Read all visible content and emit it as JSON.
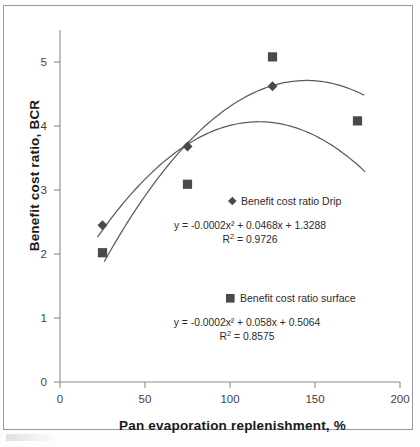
{
  "figure": {
    "background": "#ffffff",
    "border_color": "#9a9a9a"
  },
  "axes": {
    "x_title": "Pan evaporation replenishment, %",
    "y_title": "Benefit cost ratio, BCR",
    "x_ticks": [
      "0",
      "50",
      "100",
      "150",
      "200"
    ],
    "y_ticks": [
      "0",
      "1",
      "2",
      "3",
      "4",
      "5"
    ]
  },
  "legend": {
    "drip": {
      "marker": "diamond-marker",
      "label": "Benefit cost ratio Drip",
      "equation": "y = -0.0002x² + 0.0468x + 1.3288",
      "r2_prefix": "R",
      "r2_sup": "2",
      "r2_value": " = 0.9726"
    },
    "surface": {
      "marker": "square-marker",
      "label": "Benefit cost ratio surface",
      "equation": "y = -0.0002x² + 0.058x + 0.5064",
      "r2_prefix": "R",
      "r2_sup": "2",
      "r2_value": " = 0.8575"
    }
  },
  "colors": {
    "marker": "#4a4a4a",
    "trendline": "#5c5c5c",
    "axis": "#8c8c8c",
    "text": "#2b2b2b"
  },
  "chart_data": {
    "type": "scatter",
    "title": "",
    "xlabel": "Pan evaporation replenishment, %",
    "ylabel": "Benefit cost ratio, BCR",
    "xlim": [
      0,
      200
    ],
    "ylim": [
      0,
      5.5
    ],
    "xticks": [
      0,
      50,
      100,
      150,
      200
    ],
    "yticks": [
      0,
      1,
      2,
      3,
      4,
      5
    ],
    "grid": false,
    "legend_position": "inside-right",
    "series": [
      {
        "name": "Benefit cost ratio Drip",
        "marker": "diamond",
        "x": [
          25,
          75,
          125
        ],
        "y": [
          2.45,
          3.68,
          4.62
        ],
        "trendline": {
          "type": "polynomial2",
          "equation": "y = -0.0002x² + 0.0468x + 1.3288",
          "coefficients": [
            -0.0002,
            0.0468,
            1.3288
          ],
          "r_squared": 0.9726
        }
      },
      {
        "name": "Benefit cost ratio surface",
        "marker": "square",
        "x": [
          25,
          75,
          125,
          175
        ],
        "y": [
          2.02,
          3.09,
          5.08,
          4.08
        ],
        "trendline": {
          "type": "polynomial2",
          "equation": "y = -0.0002x² + 0.058x + 0.5064",
          "coefficients": [
            -0.0002,
            0.058,
            0.5064
          ],
          "r_squared": 0.8575
        }
      }
    ]
  }
}
